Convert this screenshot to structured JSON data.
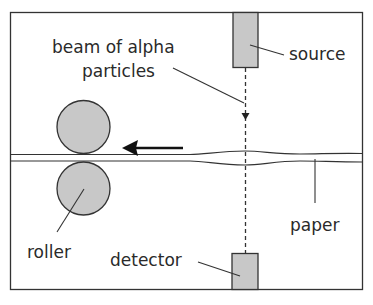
{
  "diagram": {
    "labels": {
      "beam_line1": "beam of alpha",
      "beam_line2": "particles",
      "source": "source",
      "paper": "paper",
      "roller": "roller",
      "detector": "detector"
    },
    "colors": {
      "outline": "#333333",
      "fill_gray": "#c8c8c8",
      "background": "#ffffff"
    },
    "motion_direction": "left"
  }
}
